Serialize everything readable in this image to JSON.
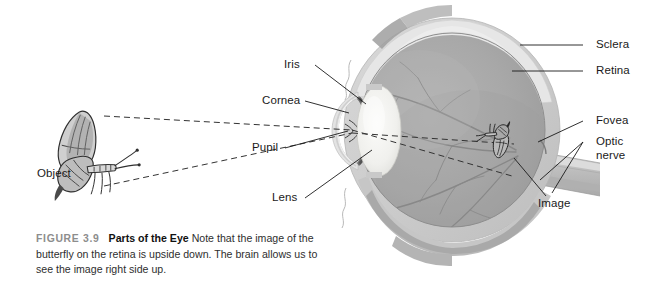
{
  "figure": {
    "number": "FIGURE 3.9",
    "title": "Parts of the Eye",
    "body": "Note that the image of the butterfly on the retina is upside down. The brain allows us to see the image right side up."
  },
  "labels": {
    "iris": "Iris",
    "cornea": "Cornea",
    "pupil": "Pupil",
    "lens": "Lens",
    "object": "Object",
    "sclera": "Sclera",
    "retina": "Retina",
    "fovea": "Fovea",
    "optic_nerve": "Optic\nnerve",
    "optic_nerve_line1": "Optic",
    "optic_nerve_line2": "nerve",
    "image": "Image"
  },
  "diagram": {
    "type": "anatomical-cross-section",
    "icons": {
      "butterfly_object": "butterfly-icon",
      "butterfly_image": "inverted-butterfly-icon"
    },
    "ray_paths": "dashed light rays from object converge at pupil and invert onto retina"
  },
  "colors": {
    "sclera_outer": "#c9c9c9",
    "sclera_mid": "#d8d8d8",
    "sclera_light": "#e4e4e4",
    "retina_band": "#8f8f8f",
    "choroid_band": "#7c7c7c",
    "vitreous": "#a9a9a9",
    "vitreous_dark": "#9b9b9b",
    "lens": "#f2f2f0",
    "iris": "#6f6f6f",
    "cornea": "#d3d3d3",
    "optic_nerve": "#c2c2c2",
    "vessel": "#7a7a7a",
    "leader_line": "#1a1a1a",
    "ray_line": "#333333",
    "label_text": "#1a1a1a",
    "caption_number": "#8d8d8d",
    "background": "#ffffff"
  }
}
